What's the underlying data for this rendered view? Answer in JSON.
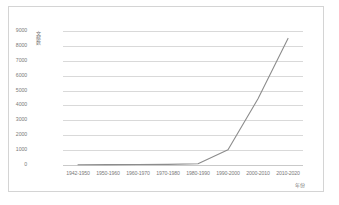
{
  "chart_data": {
    "type": "line",
    "title": "",
    "xlabel": "年份",
    "ylabel": "文献数",
    "categories": [
      "1942-1950",
      "1950-1960",
      "1960-1970",
      "1970-1980",
      "1980-1990",
      "1990-2000",
      "2000-2010",
      "2010-2020"
    ],
    "series": [
      {
        "name": "文献数",
        "values": [
          20,
          25,
          30,
          45,
          80,
          1020,
          4450,
          8500
        ]
      }
    ],
    "ylim": [
      0,
      9000
    ],
    "yticks": [
      9000,
      8000,
      7000,
      6000,
      5000,
      4000,
      3000,
      2000,
      1000,
      0
    ],
    "grid": true,
    "grid_axis": "y",
    "legend": false,
    "markers": false,
    "line_color": "#8c8c8c",
    "grid_color": "#d9d9d9",
    "text_color": "#7a7a7a",
    "border_color": "#d4d4d4",
    "plot_background": "#ffffff"
  }
}
